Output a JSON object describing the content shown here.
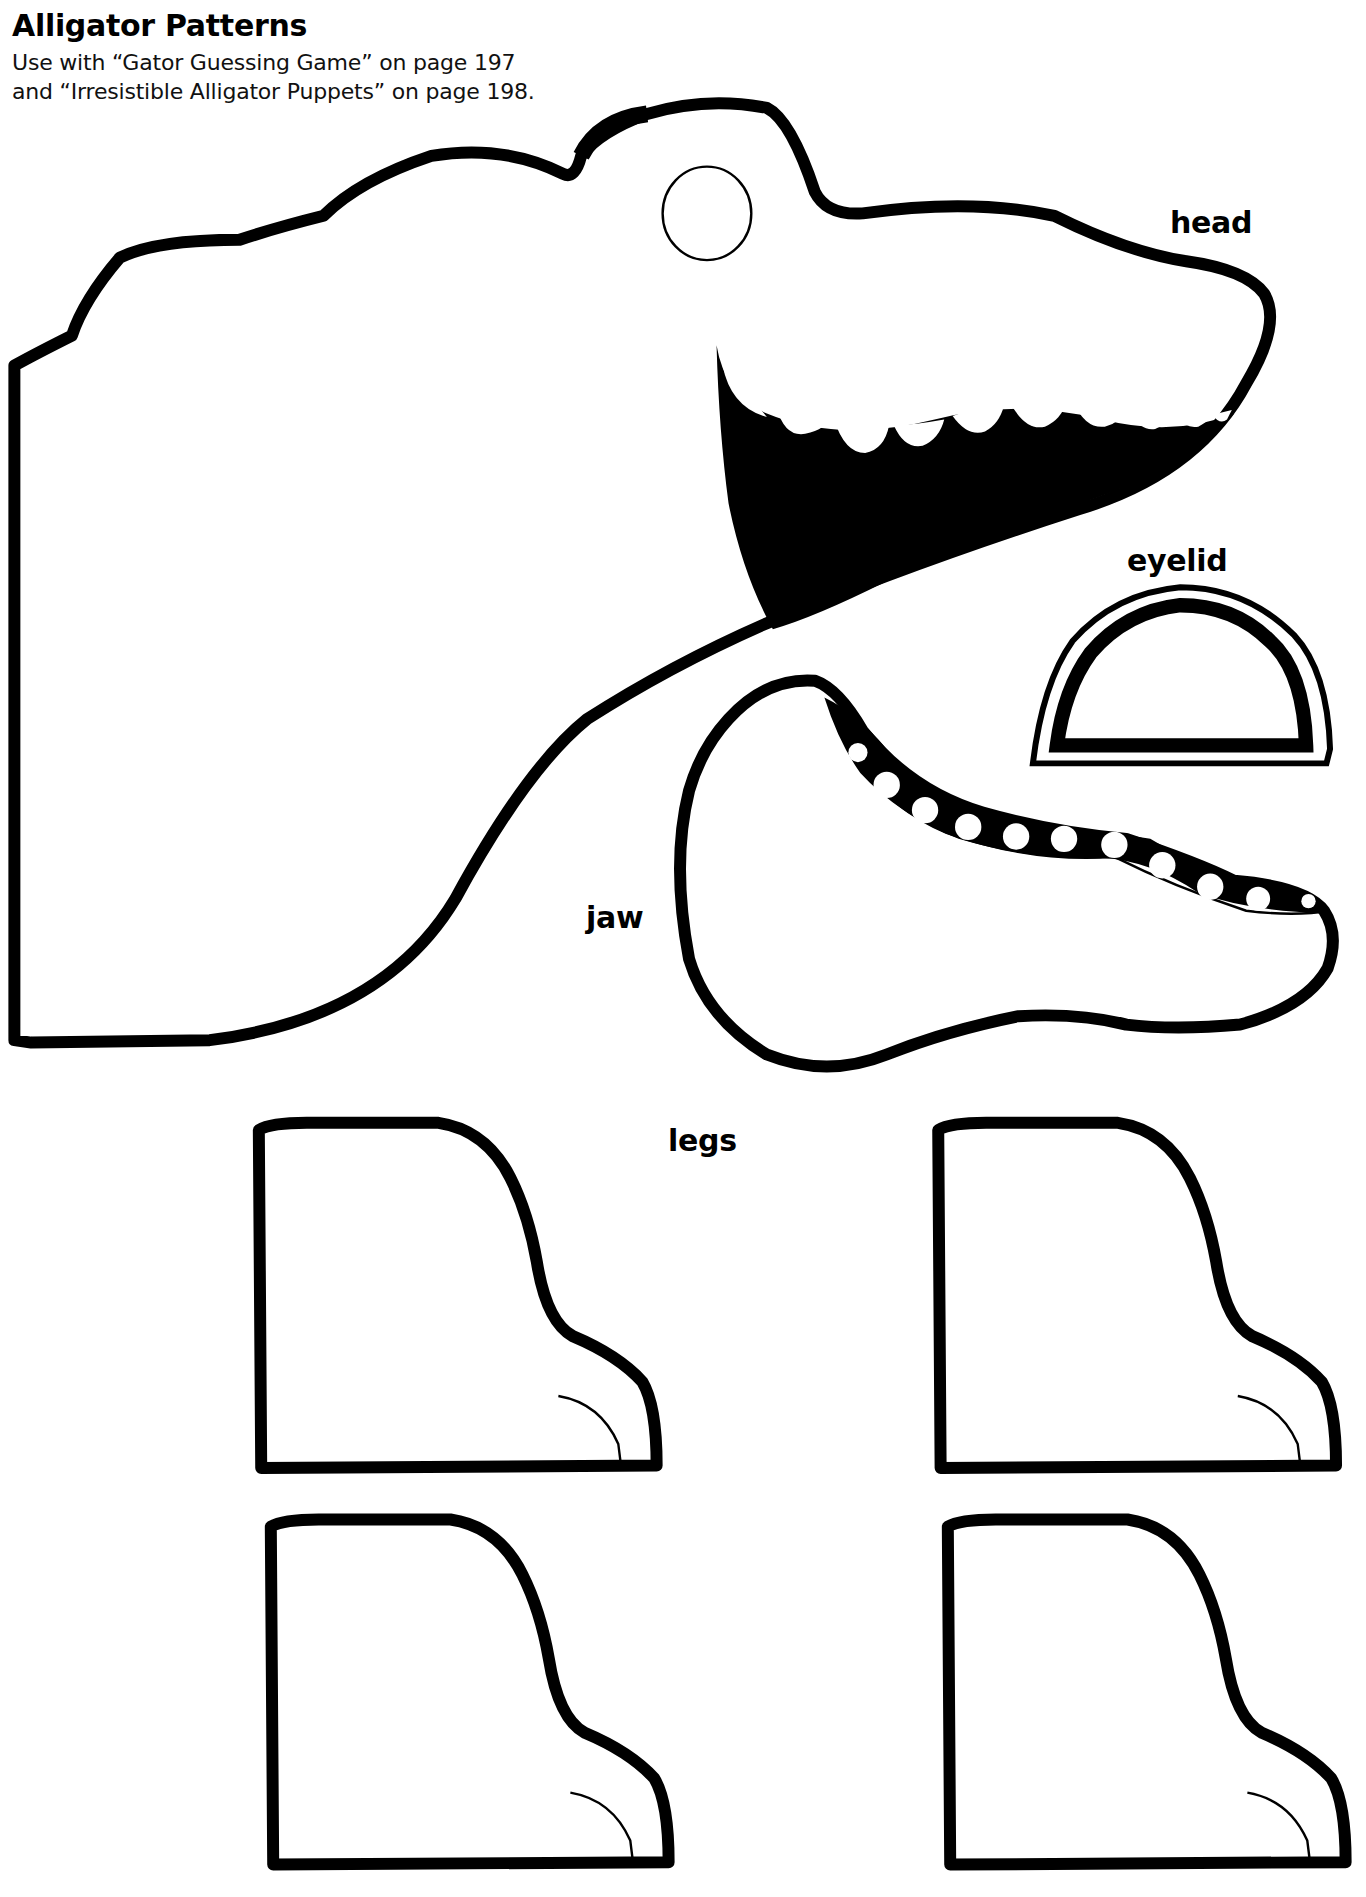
{
  "header": {
    "title": "Alligator Patterns",
    "subtitle_line1": "Use with “Gator Guessing Game” on page 197",
    "subtitle_line2": "and “Irresistible Alligator Puppets” on page 198."
  },
  "labels": {
    "head": "head",
    "eyelid": "eyelid",
    "jaw": "jaw",
    "legs": "legs"
  },
  "pieces": [
    "head",
    "eyelid",
    "jaw",
    "leg",
    "leg",
    "leg",
    "leg"
  ],
  "colors": {
    "ink": "#000000",
    "paper": "#ffffff"
  }
}
